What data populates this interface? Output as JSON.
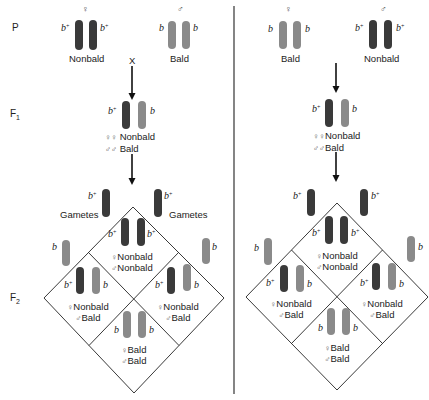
{
  "generations": {
    "p": "P",
    "f1": "F",
    "f1_sub": "1",
    "f2": "F",
    "f2_sub": "2"
  },
  "symbols": {
    "female": "♀",
    "male": "♂",
    "females": "♀♀",
    "males": "♂♂",
    "cross": "X"
  },
  "alleles": {
    "dominant": "b",
    "dominant_sup": "+",
    "recessive": "b"
  },
  "colors": {
    "dominant_chromosome": "#3a3a3a",
    "recessive_chromosome": "#8a8a8a",
    "lines": "#222222"
  },
  "left_cross": {
    "parents": {
      "female": {
        "phenotype": "Nonbald",
        "genotype": "b+ b+"
      },
      "male": {
        "phenotype": "Bald",
        "genotype": "b b"
      }
    },
    "f1": {
      "genotype": "b+ b",
      "female_phenotype": "Nonbald",
      "male_phenotype": "Bald"
    },
    "gametes_label": "Gametes",
    "f2": {
      "top": {
        "genotype": "b+ b+",
        "female": "Nonbald",
        "male": "Nonbald"
      },
      "left": {
        "genotype": "b+ b",
        "female": "Nonbald",
        "male": "Bald"
      },
      "right": {
        "genotype": "b+ b",
        "female": "Nonbald",
        "male": "Bald"
      },
      "bottom": {
        "genotype": "b b",
        "female": "Bald",
        "male": "Bald"
      }
    }
  },
  "right_cross": {
    "parents": {
      "female": {
        "phenotype": "Bald",
        "genotype": "b b"
      },
      "male": {
        "phenotype": "Nonbald",
        "genotype": "b+ b+"
      }
    },
    "f1": {
      "genotype": "b+ b",
      "female_phenotype": "Nonbald",
      "male_phenotype": "Bald"
    },
    "f2": {
      "top": {
        "genotype": "b+ b+",
        "female": "Nonbald",
        "male": "Nonbald"
      },
      "left": {
        "genotype": "b+ b",
        "female": "Nonbald",
        "male": "Bald"
      },
      "right": {
        "genotype": "b+ b",
        "female": "Nonbald",
        "male": "Bald"
      },
      "bottom": {
        "genotype": "b b",
        "female": "Bald",
        "male": "Bald"
      }
    }
  }
}
